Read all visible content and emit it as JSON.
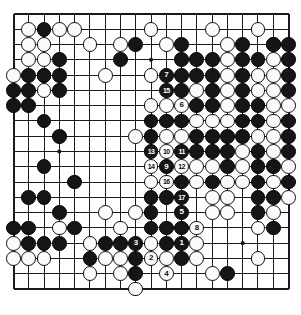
{
  "diagram": {
    "kind": "go-board-diagram",
    "board_size": 19,
    "geometry": {
      "origin_x": 13.5,
      "origin_y": 14.0,
      "spacing": 15.28,
      "stone_radius": 7.4,
      "line_color": "#1a1a1a",
      "board_color": "#ffffff",
      "border_width": 2.0
    },
    "star_points": [
      [
        3,
        3
      ],
      [
        9,
        3
      ],
      [
        15,
        3
      ],
      [
        3,
        9
      ],
      [
        9,
        9
      ],
      [
        15,
        9
      ],
      [
        3,
        15
      ],
      [
        9,
        15
      ],
      [
        15,
        15
      ]
    ],
    "black_stones": [
      [
        2,
        1
      ],
      [
        8,
        2
      ],
      [
        11,
        2
      ],
      [
        15,
        2
      ],
      [
        17,
        2
      ],
      [
        18,
        2
      ],
      [
        3,
        3
      ],
      [
        7,
        3
      ],
      [
        11,
        3
      ],
      [
        12,
        3
      ],
      [
        13,
        3
      ],
      [
        15,
        3
      ],
      [
        16,
        3
      ],
      [
        18,
        3
      ],
      [
        1,
        4
      ],
      [
        2,
        4
      ],
      [
        3,
        4
      ],
      [
        10,
        4
      ],
      [
        11,
        4
      ],
      [
        12,
        4
      ],
      [
        13,
        4
      ],
      [
        15,
        4
      ],
      [
        18,
        4
      ],
      [
        0,
        5
      ],
      [
        1,
        5
      ],
      [
        3,
        5
      ],
      [
        11,
        5
      ],
      [
        13,
        5
      ],
      [
        15,
        5
      ],
      [
        18,
        5
      ],
      [
        0,
        6
      ],
      [
        1,
        6
      ],
      [
        11,
        6
      ],
      [
        12,
        6
      ],
      [
        13,
        6
      ],
      [
        15,
        6
      ],
      [
        16,
        6
      ],
      [
        2,
        7
      ],
      [
        9,
        7
      ],
      [
        10,
        7
      ],
      [
        11,
        7
      ],
      [
        15,
        7
      ],
      [
        16,
        7
      ],
      [
        18,
        7
      ],
      [
        3,
        8
      ],
      [
        9,
        8
      ],
      [
        12,
        8
      ],
      [
        13,
        8
      ],
      [
        14,
        8
      ],
      [
        15,
        8
      ],
      [
        18,
        8
      ],
      [
        10,
        9
      ],
      [
        11,
        9
      ],
      [
        12,
        9
      ],
      [
        13,
        9
      ],
      [
        14,
        9
      ],
      [
        16,
        9
      ],
      [
        18,
        9
      ],
      [
        2,
        10
      ],
      [
        10,
        10
      ],
      [
        11,
        10
      ],
      [
        14,
        10
      ],
      [
        16,
        10
      ],
      [
        17,
        10
      ],
      [
        4,
        11
      ],
      [
        10,
        11
      ],
      [
        11,
        11
      ],
      [
        13,
        11
      ],
      [
        16,
        11
      ],
      [
        18,
        11
      ],
      [
        1,
        12
      ],
      [
        2,
        12
      ],
      [
        9,
        12
      ],
      [
        10,
        12
      ],
      [
        11,
        12
      ],
      [
        16,
        12
      ],
      [
        17,
        12
      ],
      [
        3,
        13
      ],
      [
        9,
        13
      ],
      [
        11,
        13
      ],
      [
        16,
        13
      ],
      [
        0,
        14
      ],
      [
        1,
        14
      ],
      [
        4,
        14
      ],
      [
        9,
        14
      ],
      [
        10,
        14
      ],
      [
        11,
        14
      ],
      [
        17,
        14
      ],
      [
        1,
        15
      ],
      [
        2,
        15
      ],
      [
        3,
        15
      ],
      [
        6,
        15
      ],
      [
        7,
        15
      ],
      [
        8,
        15
      ],
      [
        10,
        15
      ],
      [
        5,
        16
      ],
      [
        8,
        16
      ],
      [
        11,
        16
      ],
      [
        8,
        17
      ],
      [
        14,
        17
      ]
    ],
    "white_stones": [
      [
        1,
        1
      ],
      [
        3,
        1
      ],
      [
        4,
        1
      ],
      [
        9,
        1
      ],
      [
        13,
        1
      ],
      [
        16,
        1
      ],
      [
        1,
        2
      ],
      [
        2,
        2
      ],
      [
        5,
        2
      ],
      [
        7,
        2
      ],
      [
        10,
        2
      ],
      [
        14,
        2
      ],
      [
        17,
        2
      ],
      [
        1,
        3
      ],
      [
        2,
        3
      ],
      [
        14,
        3
      ],
      [
        17,
        3
      ],
      [
        0,
        4
      ],
      [
        2,
        4
      ],
      [
        6,
        4
      ],
      [
        9,
        4
      ],
      [
        14,
        4
      ],
      [
        16,
        4
      ],
      [
        17,
        4
      ],
      [
        2,
        5
      ],
      [
        10,
        5
      ],
      [
        12,
        5
      ],
      [
        14,
        5
      ],
      [
        16,
        5
      ],
      [
        17,
        5
      ],
      [
        9,
        6
      ],
      [
        10,
        6
      ],
      [
        14,
        6
      ],
      [
        17,
        6
      ],
      [
        18,
        6
      ],
      [
        12,
        7
      ],
      [
        13,
        7
      ],
      [
        14,
        7
      ],
      [
        17,
        7
      ],
      [
        8,
        8
      ],
      [
        10,
        8
      ],
      [
        11,
        8
      ],
      [
        16,
        8
      ],
      [
        17,
        8
      ],
      [
        9,
        9
      ],
      [
        15,
        9
      ],
      [
        17,
        9
      ],
      [
        9,
        10
      ],
      [
        12,
        10
      ],
      [
        13,
        10
      ],
      [
        15,
        10
      ],
      [
        18,
        10
      ],
      [
        9,
        11
      ],
      [
        12,
        11
      ],
      [
        14,
        11
      ],
      [
        15,
        11
      ],
      [
        17,
        11
      ],
      [
        13,
        12
      ],
      [
        14,
        12
      ],
      [
        18,
        12
      ],
      [
        6,
        13
      ],
      [
        8,
        13
      ],
      [
        13,
        13
      ],
      [
        14,
        13
      ],
      [
        17,
        13
      ],
      [
        3,
        14
      ],
      [
        7,
        14
      ],
      [
        16,
        14
      ],
      [
        0,
        15
      ],
      [
        5,
        15
      ],
      [
        9,
        15
      ],
      [
        11,
        15
      ],
      [
        12,
        15
      ],
      [
        0,
        16
      ],
      [
        1,
        16
      ],
      [
        2,
        16
      ],
      [
        6,
        16
      ],
      [
        7,
        16
      ],
      [
        9,
        16
      ],
      [
        10,
        16
      ],
      [
        12,
        16
      ],
      [
        16,
        16
      ],
      [
        5,
        17
      ],
      [
        7,
        17
      ],
      [
        13,
        17
      ],
      [
        8,
        18
      ]
    ],
    "numbered_moves": [
      {
        "n": "1",
        "color": "black",
        "col": 11,
        "row": 15
      },
      {
        "n": "2",
        "color": "white",
        "col": 9,
        "row": 16
      },
      {
        "n": "3",
        "color": "black",
        "col": 8,
        "row": 15
      },
      {
        "n": "4",
        "color": "white",
        "col": 10,
        "row": 17
      },
      {
        "n": "5",
        "color": "black",
        "col": 11,
        "row": 13
      },
      {
        "n": "6",
        "color": "white",
        "col": 11,
        "row": 6
      },
      {
        "n": "7",
        "color": "black",
        "col": 10,
        "row": 4
      },
      {
        "n": "8",
        "color": "white",
        "col": 12,
        "row": 14
      },
      {
        "n": "9",
        "color": "black",
        "col": 10,
        "row": 10
      },
      {
        "n": "10",
        "color": "white",
        "col": 10,
        "row": 9
      },
      {
        "n": "11",
        "color": "black",
        "col": 11,
        "row": 9
      },
      {
        "n": "12",
        "color": "white",
        "col": 11,
        "row": 10
      },
      {
        "n": "13",
        "color": "black",
        "col": 9,
        "row": 9
      },
      {
        "n": "14",
        "color": "white",
        "col": 9,
        "row": 10
      },
      {
        "n": "15",
        "color": "black",
        "col": 10,
        "row": 5
      },
      {
        "n": "16",
        "color": "white",
        "col": 10,
        "row": 11
      },
      {
        "n": "17",
        "color": "black",
        "col": 11,
        "row": 12
      }
    ]
  }
}
